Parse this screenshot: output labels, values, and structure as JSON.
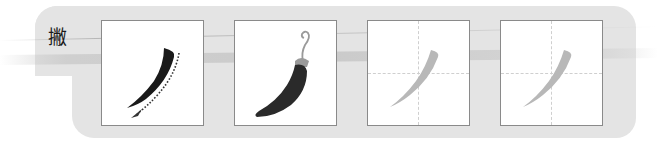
{
  "stroke_name": "撇",
  "colors": {
    "panel": "#e4e4e4",
    "box_border": "#8a8a8a",
    "stroke_dark": "#1a1a1a",
    "stroke_trace": "#b8b8b8",
    "pepper_body": "#2a2a2a",
    "pepper_stem": "#9a9a9a",
    "guide_line": "#cfcfcf"
  },
  "boxes": [
    {
      "id": "demo",
      "content": "black stroke with dotted direction arrow",
      "icon": "stroke-direction-icon"
    },
    {
      "id": "analogy",
      "content": "chili pepper shape analogy",
      "icon": "chili-pepper-icon"
    },
    {
      "id": "trace-1",
      "content": "gray tracing stroke on grid",
      "icon": "trace-stroke-icon"
    },
    {
      "id": "trace-2",
      "content": "gray tracing stroke on grid",
      "icon": "trace-stroke-icon"
    }
  ]
}
